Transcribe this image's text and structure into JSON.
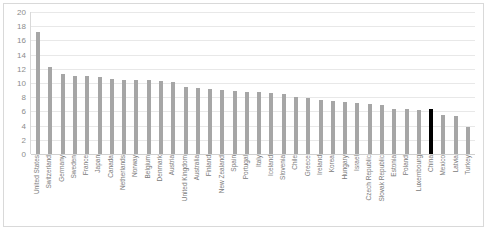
{
  "chart_data": {
    "type": "bar",
    "title": "",
    "subtitle": "",
    "xlabel": "",
    "ylabel": "",
    "ylim": [
      0,
      20
    ],
    "ytick_step": 2,
    "yticks": [
      "20",
      "18",
      "16",
      "14",
      "12",
      "10",
      "8",
      "6",
      "4",
      "2",
      "0"
    ],
    "grid": true,
    "legend": "none",
    "highlight_category": "China",
    "colors": {
      "bar": "#a6a6a6",
      "highlight_bar": "#000000",
      "gridline": "#e8e8e8",
      "axis_text": "#8c8c8c",
      "border": "#d9d9d9"
    },
    "categories": [
      "United States",
      "Switzerland",
      "Germany",
      "Sweden",
      "France",
      "Japan",
      "Canada",
      "Netherlands",
      "Norway",
      "Belgium",
      "Denmark",
      "Austria",
      "United Kingdom",
      "Australia",
      "Finland",
      "New Zealand",
      "Spain",
      "Portugal",
      "Italy",
      "Iceland",
      "Slovenia",
      "Chile",
      "Greece",
      "Ireland",
      "Korea",
      "Hungary",
      "Israel",
      "Czech Republic",
      "Slovak Republic",
      "Estonia",
      "Poland",
      "Luxembourg",
      "China",
      "Mexico",
      "Latvia",
      "Turkey"
    ],
    "values": [
      17.2,
      12.2,
      11.2,
      11.0,
      11.0,
      10.9,
      10.5,
      10.4,
      10.4,
      10.4,
      10.3,
      10.2,
      9.4,
      9.3,
      9.2,
      9.0,
      8.9,
      8.8,
      8.7,
      8.6,
      8.5,
      8.0,
      7.9,
      7.6,
      7.4,
      7.3,
      7.2,
      7.0,
      6.9,
      6.4,
      6.3,
      6.2,
      6.3,
      5.5,
      5.4,
      3.8
    ]
  }
}
